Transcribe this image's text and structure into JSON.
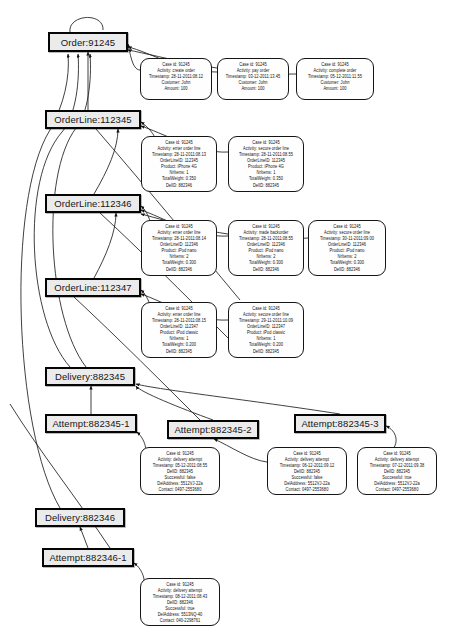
{
  "figure": {
    "kind": "object-centric event graph",
    "entity_node_names": [
      "Order",
      "OrderLine",
      "Delivery",
      "Attempt"
    ]
  },
  "entities": [
    {
      "id": "order-91245",
      "label": "Order:91245",
      "x": 48,
      "y": 32,
      "w": 80,
      "h": 20
    },
    {
      "id": "orderline-112345",
      "label": "OrderLine:112345",
      "x": 45,
      "y": 110,
      "w": 96,
      "h": 19
    },
    {
      "id": "orderline-112346",
      "label": "OrderLine:112346",
      "x": 45,
      "y": 194,
      "w": 96,
      "h": 19
    },
    {
      "id": "orderline-112347",
      "label": "OrderLine:112347",
      "x": 45,
      "y": 278,
      "w": 96,
      "h": 19
    },
    {
      "id": "delivery-882345",
      "label": "Delivery:882345",
      "x": 45,
      "y": 367,
      "w": 90,
      "h": 19
    },
    {
      "id": "attempt-882345-1",
      "label": "Attempt:882345-1",
      "x": 45,
      "y": 414,
      "w": 92,
      "h": 19
    },
    {
      "id": "attempt-882345-2",
      "label": "Attempt:882345-2",
      "x": 167,
      "y": 420,
      "w": 92,
      "h": 19
    },
    {
      "id": "attempt-882345-3",
      "label": "Attempt:882345-3",
      "x": 294,
      "y": 414,
      "w": 92,
      "h": 19
    },
    {
      "id": "delivery-882346",
      "label": "Delivery:882346",
      "x": 35,
      "y": 508,
      "w": 90,
      "h": 19
    },
    {
      "id": "attempt-882346-1",
      "label": "Attempt:882346-1",
      "x": 42,
      "y": 548,
      "w": 92,
      "h": 19
    }
  ],
  "events": [
    {
      "id": "ev-create-order",
      "x": 140,
      "y": 58,
      "w": 72,
      "h": 42,
      "lines": [
        "Case id: 91245",
        "Activity: create order",
        "Timestamp: 28-11-2011:08.12",
        "Customer: John",
        "Amount: 100"
      ]
    },
    {
      "id": "ev-pay-order",
      "x": 217,
      "y": 58,
      "w": 72,
      "h": 42,
      "lines": [
        "Case id: 91245",
        "Activity: pay order",
        "Timestamp: 03-12-2011:13.45",
        "Customer: John",
        "Amount: 100"
      ]
    },
    {
      "id": "ev-complete-order",
      "x": 296,
      "y": 58,
      "w": 78,
      "h": 42,
      "lines": [
        "Case id: 91245",
        "Activity: complete order",
        "Timestamp: 05-12-2011:11.55",
        "Customer: John",
        "Amount: 100"
      ]
    },
    {
      "id": "ev-enter-line-112345",
      "x": 141,
      "y": 136,
      "w": 76,
      "h": 56,
      "lines": [
        "Case id: 91245",
        "Activity: enter order line",
        "Timestamp: 28-11-2011:08.13",
        "OrderLineID: 112345",
        "Product: iPhone 4G",
        "NrItems: 1",
        "TotalWeight: 0.350",
        "DelID: 882346"
      ]
    },
    {
      "id": "ev-secure-line-112345",
      "x": 228,
      "y": 136,
      "w": 76,
      "h": 56,
      "lines": [
        "Case id: 91245",
        "Activity: secure order line",
        "Timestamp: 28-11-2011:08.55",
        "OrderLineID: 112345",
        "Product: iPhone 4G",
        "NrItems: 1",
        "TotalWeight: 0.350",
        "DelID: 882345"
      ]
    },
    {
      "id": "ev-enter-line-112346",
      "x": 141,
      "y": 220,
      "w": 76,
      "h": 56,
      "lines": [
        "Case id: 91245",
        "Activity: enter order line",
        "Timestamp: 28-11-2011:08.14",
        "OrderLineID: 112346",
        "Product: iPod nano",
        "NrItems: 2",
        "TotalWeight: 0.300",
        "DelID: 882346"
      ]
    },
    {
      "id": "ev-backorder-112346",
      "x": 228,
      "y": 220,
      "w": 76,
      "h": 56,
      "lines": [
        "Case id: 91245",
        "Activity: made backorder",
        "Timestamp: 28-11-2011:08.55",
        "OrderLineID: 112346",
        "Product: iPod nano",
        "NrItems: 2",
        "TotalWeight: 0.300",
        "DelID: 882346"
      ]
    },
    {
      "id": "ev-secure-line-112346",
      "x": 308,
      "y": 220,
      "w": 78,
      "h": 56,
      "lines": [
        "Case id: 91245",
        "Activity: secure order line",
        "Timestamp: 30-11-2011:09.00",
        "OrderLineID: 112346",
        "Product: iPod nano",
        "NrItems: 2",
        "TotalWeight: 0.300",
        "DelID: 882346"
      ]
    },
    {
      "id": "ev-enter-line-112347",
      "x": 141,
      "y": 302,
      "w": 76,
      "h": 56,
      "lines": [
        "Case id: 91245",
        "Activity: enter order line",
        "Timestamp: 28-11-2011:08.15",
        "OrderLineID: 112347",
        "Product: iPod classic",
        "NrItems: 1",
        "TotalWeight: 0.200",
        "DelID: 882345"
      ]
    },
    {
      "id": "ev-secure-line-112347",
      "x": 228,
      "y": 302,
      "w": 76,
      "h": 56,
      "lines": [
        "Case id: 91245",
        "Activity: secure order line",
        "Timestamp: 29-11-2011:10.09",
        "OrderLineID: 112347",
        "Product: iPod classic",
        "NrItems: 1",
        "TotalWeight: 0.200",
        "DelID: 882345"
      ]
    },
    {
      "id": "ev-attempt-882345-1",
      "x": 140,
      "y": 447,
      "w": 80,
      "h": 48,
      "lines": [
        "Case id: 91245",
        "Activity: delivery attempt",
        "Timestamp: 05-12-2011:08.55",
        "DelID: 882345",
        "Successful: false",
        "DelAddress: 5512VJ-22a",
        "Contact: 0497-2553680"
      ]
    },
    {
      "id": "ev-attempt-882345-2",
      "x": 267,
      "y": 447,
      "w": 80,
      "h": 48,
      "lines": [
        "Case id: 91245",
        "Activity: delivery attempt",
        "Timestamp: 06-12-2011:09.12",
        "DelID: 882345",
        "Successful: false",
        "DelAddress: 5512VJ-22a",
        "Contact: 0497-2553680"
      ]
    },
    {
      "id": "ev-attempt-882345-3",
      "x": 357,
      "y": 447,
      "w": 80,
      "h": 48,
      "lines": [
        "Case id: 91245",
        "Activity: delivery attempt",
        "Timestamp: 07-12-2011:09.38",
        "DelID: 882345",
        "Successful: true",
        "DelAddress: 5512VJ-22a",
        "Contact: 0497-2553680"
      ]
    },
    {
      "id": "ev-attempt-882346-1",
      "x": 140,
      "y": 578,
      "w": 80,
      "h": 48,
      "lines": [
        "Case id: 91245",
        "Activity: delivery attempt",
        "Timestamp: 08-12-2011:08.43",
        "DelID: 882346",
        "Successful: true",
        "DelAddress: 5513NQ-40",
        "Contact: 040-2298761"
      ]
    }
  ],
  "edges": [
    {
      "id": "e-order-self",
      "d": "M 70 32 C 68 14 104 12 103 30"
    },
    {
      "id": "e-ol1-order",
      "d": "M 88 110 L 88 52"
    },
    {
      "id": "e-ev-create-order",
      "d": "M 140 70 C 132 70 130 52 128 44"
    },
    {
      "id": "e-ev-pay-order",
      "d": "M 217 72 C 180 72 150 52 128 47"
    },
    {
      "id": "e-ev-complete-order",
      "d": "M 296 74 C 230 76 160 56 128 50"
    },
    {
      "id": "e-ev-enter-112345",
      "d": "M 141 150 C 170 150 150 128 141 122"
    },
    {
      "id": "e-ev-secure-112345",
      "d": "M 228 152 C 200 154 160 132 141 126"
    },
    {
      "id": "e-ol2-ol1",
      "d": "M 94 194 C 108 170 118 148 118 129"
    },
    {
      "id": "e-ev-enter-112346",
      "d": "M 141 234 C 158 232 148 212 141 206"
    },
    {
      "id": "e-ev-backorder",
      "d": "M 228 236 C 196 238 160 216 141 210"
    },
    {
      "id": "e-ev-secure-112346",
      "d": "M 308 238 C 240 244 165 220 141 214"
    },
    {
      "id": "e-ol3-ol2",
      "d": "M 94 278 C 106 256 116 232 116 213"
    },
    {
      "id": "e-ev-enter-112347",
      "d": "M 141 318 C 158 316 148 296 141 290"
    },
    {
      "id": "e-ev-secure-112347",
      "d": "M 228 320 C 196 322 160 300 141 294"
    },
    {
      "id": "e-del1-up-a",
      "d": "M 70 367 C 28 320 20 180 62 132 C 76 116 80 80 78 54"
    },
    {
      "id": "e-del1-up-b",
      "d": "M 86 367 C 48 318 40 176 76 128 C 88 114 92 80 90 54"
    },
    {
      "id": "e-del2-up",
      "d": "M 60 508 C 14 430 6 200 50 130 C 64 104 70 78 68 54"
    },
    {
      "id": "e-at1-del1",
      "d": "M 91 414 L 91 386"
    },
    {
      "id": "e-at2-del1",
      "d": "M 213 420 C 180 408 140 392 136 386"
    },
    {
      "id": "e-at3-del1",
      "d": "M 340 414 C 250 400 160 390 136 384"
    },
    {
      "id": "e-ev-at1",
      "d": "M 140 462 C 150 456 146 440 137 432"
    },
    {
      "id": "e-ev-at2",
      "d": "M 267 462 C 250 460 230 446 214 439"
    },
    {
      "id": "e-ev-at3",
      "d": "M 357 462 C 400 462 404 434 386 426"
    },
    {
      "id": "e-at4-del2",
      "d": "M 88 548 L 80 527"
    },
    {
      "id": "e-ev-at4",
      "d": "M 140 592 C 148 586 144 570 134 563"
    },
    {
      "id": "e-del2-cross",
      "d": "M 10 404 C 40 452 78 500 110 548"
    },
    {
      "id": "e-ol-cross-a",
      "d": "M 74 297 C 120 340 160 380 210 430"
    },
    {
      "id": "e-ol-cross-b",
      "d": "M 96 129 C 140 180 190 240 240 300"
    },
    {
      "id": "e-ol-cross-c",
      "d": "M 100 213 C 140 250 180 290 230 340"
    }
  ]
}
